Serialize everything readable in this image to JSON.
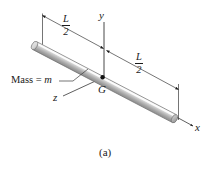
{
  "figure": {
    "caption": "(a)",
    "axes": {
      "y_label": "y",
      "x_label": "x",
      "z_label": "z"
    },
    "points": {
      "center_of_mass_label": "G"
    },
    "annotations": {
      "mass_label_prefix": "Mass = ",
      "mass_label_symbol": "m",
      "left_dimension": {
        "numerator": "L",
        "denominator": "2"
      },
      "right_dimension": {
        "numerator": "L",
        "denominator": "2"
      }
    },
    "colors": {
      "line": "#1a1a1a",
      "rod_light": "#f2f2f2",
      "rod_mid": "#c8c8c8",
      "rod_dark": "#9a9a9a",
      "rod_outline": "#6e6e6e",
      "dimension_line": "#555555",
      "background": "#ffffff"
    }
  }
}
